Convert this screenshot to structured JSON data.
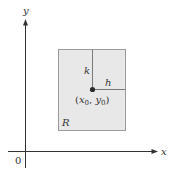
{
  "diagram": {
    "axes": {
      "x_label": "x",
      "y_label": "y",
      "origin_label": "0"
    },
    "region": {
      "label": "R",
      "fill": "#e8e8e8",
      "stroke": "#9a9a9a"
    },
    "point": {
      "label_open": "(",
      "x_sym": "x",
      "x_sub": "0",
      "comma": ", ",
      "y_sym": "y",
      "y_sub": "0",
      "label_close": ")"
    },
    "segments": {
      "vertical_label": "k",
      "horizontal_label": "h"
    }
  }
}
